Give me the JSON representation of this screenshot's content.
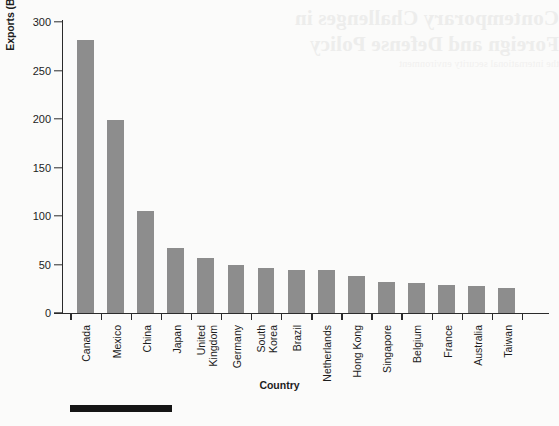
{
  "chart_data": {
    "type": "bar",
    "title": "",
    "xlabel": "Country",
    "ylabel": "Exports (Billions of Dollars)",
    "categories": [
      "Canada",
      "Mexico",
      "China",
      "Japan",
      "United Kingdom",
      "Germany",
      "South Korea",
      "Brazil",
      "Netherlands",
      "Hong Kong",
      "Singapore",
      "Belgium",
      "France",
      "Australia",
      "Taiwan"
    ],
    "category_lines": [
      [
        "Canada"
      ],
      [
        "Mexico"
      ],
      [
        "China"
      ],
      [
        "Japan"
      ],
      [
        "United",
        "Kingdom"
      ],
      [
        "Germany"
      ],
      [
        "South",
        "Korea"
      ],
      [
        "Brazil"
      ],
      [
        "Netherlands"
      ],
      [
        "Hong Kong"
      ],
      [
        "Singapore"
      ],
      [
        "Belgium"
      ],
      [
        "France"
      ],
      [
        "Australia"
      ],
      [
        "Taiwan"
      ]
    ],
    "values": [
      281,
      199,
      105,
      67,
      57,
      50,
      46,
      44,
      44,
      38,
      32,
      31,
      29,
      28,
      26
    ],
    "ylim": [
      0,
      300
    ],
    "yticks": [
      0,
      50,
      100,
      150,
      200,
      250,
      300
    ],
    "ytick_labels": [
      "0",
      "50",
      "100",
      "150",
      "200",
      "250",
      "300"
    ],
    "grid": false,
    "legend": false,
    "bar_color": "#8d8d8d",
    "axis_color": "#2b2b2b"
  },
  "artifact": {
    "bleed_line_1": "Contemporary Challenges in",
    "bleed_line_2": "Foreign and Defense Policy",
    "bleed_line_3": "the international security environment"
  },
  "footer": {
    "rule_color": "#151515"
  }
}
